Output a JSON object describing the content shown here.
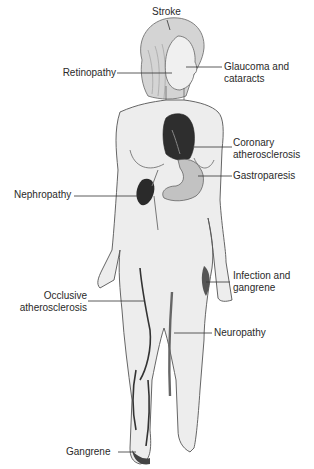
{
  "diagram": {
    "type": "anatomical-figure",
    "labels": [
      {
        "id": "stroke",
        "text": "Stroke"
      },
      {
        "id": "retinopathy",
        "text": "Retinopathy"
      },
      {
        "id": "glaucoma",
        "line1": "Glaucoma and",
        "line2": "cataracts"
      },
      {
        "id": "coronary",
        "line1": "Coronary",
        "line2": "atherosclerosis"
      },
      {
        "id": "gastroparesis",
        "text": "Gastroparesis"
      },
      {
        "id": "nephropathy",
        "text": "Nephropathy"
      },
      {
        "id": "infection",
        "line1": "Infection and",
        "line2": "gangrene"
      },
      {
        "id": "occlusive",
        "line1": "Occlusive",
        "line2": "atherosclerosis"
      },
      {
        "id": "neuropathy",
        "text": "Neuropathy"
      },
      {
        "id": "gangrene",
        "text": "Gangrene"
      }
    ],
    "colors": {
      "skin": "#eeeeee",
      "outline": "#555555",
      "hair": "#cfcfcf",
      "organ_dark": "#333333",
      "stomach": "#bdbdbd",
      "leader_line": "#333333"
    }
  }
}
